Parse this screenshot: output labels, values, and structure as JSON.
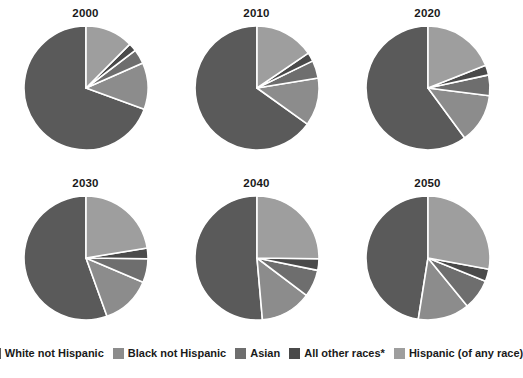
{
  "chart_data": {
    "type": "pie",
    "title": "",
    "subtitle": "",
    "xlabel": "",
    "ylabel": "",
    "grid": false,
    "legend_position": "bottom",
    "categories": [
      "White not Hispanic",
      "Black not Hispanic",
      "Asian",
      "All other races*",
      "Hispanic (of any race)"
    ],
    "colors": [
      "#5a5a5a",
      "#8c8c8c",
      "#6e6e6e",
      "#4a4a4a",
      "#9e9e9e"
    ],
    "slice_border_color": "#ffffff",
    "start_angle_deg": 90,
    "direction": "counterclockwise",
    "panels": [
      {
        "title": "2000",
        "values": [
          69.4,
          12.2,
          3.8,
          2.1,
          12.5
        ]
      },
      {
        "title": "2010",
        "values": [
          65.1,
          12.5,
          4.6,
          2.3,
          15.5
        ]
      },
      {
        "title": "2020",
        "values": [
          60.1,
          12.9,
          5.4,
          2.6,
          19.0
        ]
      },
      {
        "title": "2030",
        "values": [
          55.5,
          13.1,
          6.2,
          2.8,
          22.4
        ]
      },
      {
        "title": "2040",
        "values": [
          51.4,
          13.3,
          7.1,
          3.0,
          25.2
        ]
      },
      {
        "title": "2050",
        "values": [
          47.5,
          13.4,
          8.0,
          3.2,
          27.9
        ]
      }
    ]
  },
  "legend": {
    "items": [
      {
        "label": "White not Hispanic",
        "color": "#5a5a5a"
      },
      {
        "label": "Black not Hispanic",
        "color": "#8c8c8c"
      },
      {
        "label": "Asian",
        "color": "#6e6e6e"
      },
      {
        "label": "All other races*",
        "color": "#4a4a4a"
      },
      {
        "label": "Hispanic (of any race)",
        "color": "#9e9e9e"
      }
    ]
  }
}
